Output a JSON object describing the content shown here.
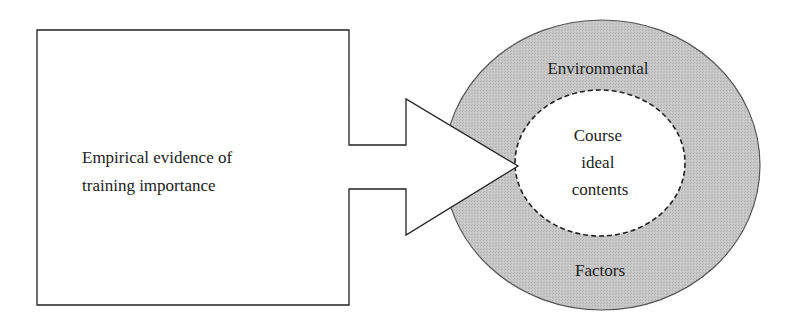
{
  "diagram": {
    "left_box": {
      "lines": [
        "Empirical evidence of",
        "training importance"
      ]
    },
    "outer_ring": {
      "top_label": "Environmental",
      "bottom_label": "Factors",
      "fill": "#c4c4c4"
    },
    "inner_circle": {
      "lines": [
        "Course",
        "ideal",
        "contents"
      ],
      "fill": "#ffffff"
    },
    "connector": "arrow-from-box-to-inner-circle"
  }
}
